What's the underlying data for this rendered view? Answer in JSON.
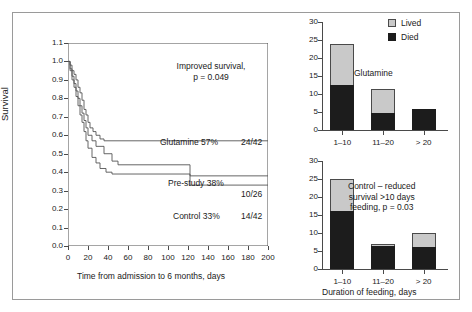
{
  "figure": {
    "background": "#ffffff",
    "frame_color": "#9a9a9a"
  },
  "colors": {
    "lived": "#c9c9c9",
    "died": "#1c1c1c",
    "axis": "#4a4a4a",
    "curve": "#555555"
  },
  "km_panel": {
    "ylabel": "Survival",
    "xlabel": "Time from admission to 6 months, days",
    "y_ticks": [
      "0.0",
      "0.1",
      "0.2",
      "0.3",
      "0.4",
      "0.5",
      "0.6",
      "0.7",
      "0.8",
      "0.9",
      "1.0",
      "1.1"
    ],
    "x_ticks": [
      "0",
      "20",
      "40",
      "60",
      "80",
      "100",
      "120",
      "140",
      "160",
      "180",
      "200"
    ],
    "annotation_line1": "Improved survival,",
    "annotation_line2": "p = 0.049",
    "curve_labels": [
      {
        "label": "Glutamine 57%",
        "ratio": "24/42"
      },
      {
        "label": "Pre-study 38%",
        "ratio": "10/26"
      },
      {
        "label": "Control 33%",
        "ratio": "14/42"
      }
    ]
  },
  "legend": {
    "items": [
      {
        "key": "lived",
        "label": "Lived",
        "color": "#c9c9c9"
      },
      {
        "key": "died",
        "label": "Died",
        "color": "#1c1c1c"
      }
    ]
  },
  "top_bar_panel": {
    "annotation": "Glutamine",
    "y_ticks": [
      "0",
      "5",
      "10",
      "15",
      "20",
      "25",
      "30"
    ],
    "categories": [
      "1–10",
      "11–20",
      "> 20"
    ]
  },
  "bottom_bar_panel": {
    "annotation_line1": "Control – reduced",
    "annotation_line2": "survival >10 days",
    "annotation_line3": "feeding, p = 0.03",
    "xlabel": "Duration of feeding, days",
    "y_ticks": [
      "0",
      "5",
      "10",
      "15",
      "20",
      "25",
      "30"
    ],
    "categories": [
      "1–10",
      "11–20",
      "> 20"
    ]
  },
  "chart_data": [
    {
      "type": "line",
      "title": "Kaplan-Meier survival",
      "xlabel": "Time from admission to 6 months, days",
      "ylabel": "Survival",
      "xlim": [
        0,
        200
      ],
      "ylim": [
        0.0,
        1.1
      ],
      "grid": false,
      "annotations": [
        "Improved survival, p = 0.049"
      ],
      "series": [
        {
          "name": "Glutamine 57%",
          "final_value": 0.57,
          "ratio": "24/42",
          "points": [
            [
              0,
              1.0
            ],
            [
              2,
              0.98
            ],
            [
              4,
              0.95
            ],
            [
              6,
              0.93
            ],
            [
              8,
              0.9
            ],
            [
              10,
              0.86
            ],
            [
              12,
              0.83
            ],
            [
              14,
              0.79
            ],
            [
              16,
              0.74
            ],
            [
              18,
              0.71
            ],
            [
              20,
              0.67
            ],
            [
              22,
              0.64
            ],
            [
              25,
              0.62
            ],
            [
              28,
              0.6
            ],
            [
              32,
              0.58
            ],
            [
              36,
              0.57
            ],
            [
              60,
              0.57
            ],
            [
              100,
              0.57
            ],
            [
              150,
              0.57
            ],
            [
              200,
              0.57
            ]
          ]
        },
        {
          "name": "Pre-study 38%",
          "final_value": 0.38,
          "ratio": "10/26",
          "points": [
            [
              0,
              1.0
            ],
            [
              2,
              0.96
            ],
            [
              4,
              0.92
            ],
            [
              6,
              0.88
            ],
            [
              8,
              0.84
            ],
            [
              10,
              0.8
            ],
            [
              12,
              0.76
            ],
            [
              14,
              0.72
            ],
            [
              16,
              0.68
            ],
            [
              18,
              0.64
            ],
            [
              20,
              0.6
            ],
            [
              24,
              0.57
            ],
            [
              28,
              0.54
            ],
            [
              32,
              0.54
            ],
            [
              36,
              0.5
            ],
            [
              40,
              0.5
            ],
            [
              44,
              0.46
            ],
            [
              50,
              0.44
            ],
            [
              60,
              0.44
            ],
            [
              80,
              0.44
            ],
            [
              100,
              0.44
            ],
            [
              118,
              0.44
            ],
            [
              122,
              0.38
            ],
            [
              150,
              0.38
            ],
            [
              200,
              0.38
            ]
          ]
        },
        {
          "name": "Control 33%",
          "final_value": 0.33,
          "ratio": "14/42",
          "points": [
            [
              0,
              1.0
            ],
            [
              2,
              0.95
            ],
            [
              4,
              0.9
            ],
            [
              6,
              0.86
            ],
            [
              8,
              0.81
            ],
            [
              10,
              0.76
            ],
            [
              12,
              0.71
            ],
            [
              14,
              0.67
            ],
            [
              16,
              0.62
            ],
            [
              18,
              0.57
            ],
            [
              20,
              0.53
            ],
            [
              24,
              0.48
            ],
            [
              28,
              0.45
            ],
            [
              32,
              0.42
            ],
            [
              38,
              0.4
            ],
            [
              44,
              0.39
            ],
            [
              60,
              0.39
            ],
            [
              80,
              0.39
            ],
            [
              100,
              0.39
            ],
            [
              118,
              0.39
            ],
            [
              122,
              0.33
            ],
            [
              150,
              0.33
            ],
            [
              200,
              0.33
            ]
          ]
        }
      ]
    },
    {
      "type": "bar",
      "title": "Glutamine",
      "stacked": true,
      "xlabel": "",
      "ylabel": "",
      "ylim": [
        0,
        30
      ],
      "yticks": [
        0,
        5,
        10,
        15,
        20,
        25,
        30
      ],
      "categories": [
        "1–10",
        "11–20",
        "> 20"
      ],
      "series": [
        {
          "name": "Died",
          "values": [
            12.5,
            4.7,
            5.8
          ],
          "color": "#1c1c1c"
        },
        {
          "name": "Lived",
          "values": [
            11.5,
            6.8,
            0.0
          ],
          "color": "#c9c9c9"
        }
      ],
      "totals": [
        24.0,
        11.5,
        5.8
      ],
      "legend_position": "top-right"
    },
    {
      "type": "bar",
      "title": "Control – reduced survival >10 days feeding, p = 0.03",
      "stacked": true,
      "xlabel": "Duration of feeding, days",
      "ylabel": "",
      "ylim": [
        0,
        30
      ],
      "yticks": [
        0,
        5,
        10,
        15,
        20,
        25,
        30
      ],
      "categories": [
        "1–10",
        "11–20",
        "> 20"
      ],
      "series": [
        {
          "name": "Died",
          "values": [
            16.0,
            6.3,
            6.1
          ],
          "color": "#1c1c1c"
        },
        {
          "name": "Lived",
          "values": [
            9.1,
            0.7,
            3.9
          ],
          "color": "#c9c9c9"
        }
      ],
      "totals": [
        25.1,
        7.0,
        10.0
      ],
      "legend_position": "none"
    }
  ]
}
